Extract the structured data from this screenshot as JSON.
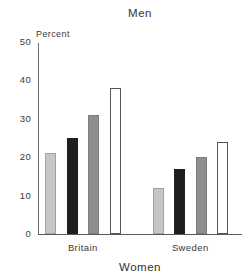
{
  "chart_data": {
    "type": "bar",
    "title_top": "Men",
    "title_bottom": "Women",
    "axis_label": "Percent",
    "categories": [
      "Britain",
      "Sweden"
    ],
    "series": [
      {
        "style": "light-gray",
        "fill": "#c6c6c6",
        "border": "#a2a2a2",
        "values": [
          21,
          12
        ]
      },
      {
        "style": "black",
        "fill": "#1f1f1f",
        "border": "#1f1f1f",
        "values": [
          25,
          17
        ]
      },
      {
        "style": "medium-gray",
        "fill": "#8f8f8f",
        "border": "#7c7c7c",
        "values": [
          31,
          20
        ]
      },
      {
        "style": "white",
        "fill": "#ffffff",
        "border": "#555555",
        "values": [
          38,
          24
        ]
      }
    ],
    "ylim": [
      0,
      50
    ],
    "yticks": [
      0,
      10,
      20,
      30,
      40,
      50
    ],
    "legend": "none",
    "grid": false
  },
  "colors": {
    "axis": "#5a5a5a",
    "text": "#2e2e2e",
    "background": "#ffffff"
  }
}
